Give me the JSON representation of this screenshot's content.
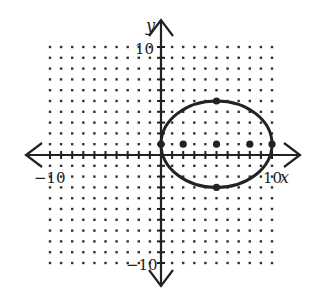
{
  "chart_data": {
    "type": "scatter",
    "title": "",
    "xlabel": "x",
    "ylabel": "y",
    "xlim": [
      -10,
      10
    ],
    "ylim": [
      -10,
      10
    ],
    "grid": "dotted",
    "tick_labels": {
      "x": [
        {
          "value": -10,
          "label": "-10"
        },
        {
          "value": 10,
          "label": "10"
        }
      ],
      "y": [
        {
          "value": 10,
          "label": "10"
        },
        {
          "value": -10,
          "label": "-10"
        }
      ]
    },
    "ellipse": {
      "center": [
        5,
        1
      ],
      "semi_major_horizontal": 5,
      "semi_minor_vertical": 4,
      "equation": "(x-5)^2/25 + (y-1)^2/16 = 1"
    },
    "points": [
      {
        "name": "center",
        "x": 5,
        "y": 1
      },
      {
        "name": "focus-left",
        "x": 2,
        "y": 1
      },
      {
        "name": "focus-right",
        "x": 8,
        "y": 1
      },
      {
        "name": "vertex-left",
        "x": 0,
        "y": 1
      },
      {
        "name": "vertex-right",
        "x": 10,
        "y": 1
      },
      {
        "name": "covertex-top",
        "x": 5,
        "y": 5
      },
      {
        "name": "covertex-bottom",
        "x": 5,
        "y": -3
      }
    ]
  },
  "labels": {
    "x_axis": "x",
    "y_axis": "y",
    "x_min": "−10",
    "x_max": "10",
    "y_max": "10",
    "y_min": "−10"
  },
  "colors": {
    "ink": "#222222",
    "grid_dot": "#333333",
    "background": "#ffffff"
  }
}
